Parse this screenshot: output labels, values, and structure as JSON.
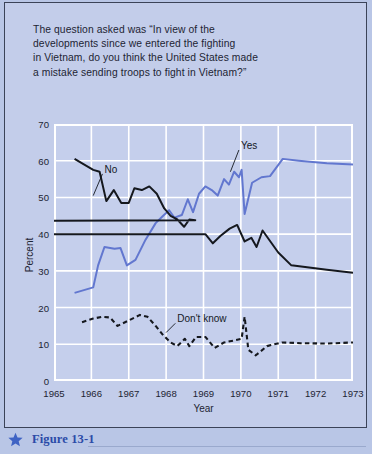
{
  "question": {
    "lines": [
      "The question asked was “In view of the",
      "developments since we entered the fighting",
      "in Vietnam, do you think the United States made",
      "a mistake sending troops to fight in Vietnam?”"
    ]
  },
  "caption": {
    "star_icon": "star-icon",
    "label": "Figure 13-1"
  },
  "colors": {
    "page_background": "#b9c6e6",
    "panel_background": "#c3cdea",
    "plot_background": "#c5cfec",
    "gridline": "#ffffff",
    "yes_series": "#6277cf",
    "no_series": "#15181e",
    "dont_know_series": "#15181e",
    "caption_blue": "#2b4ba8",
    "text": "#1d2433"
  },
  "chart_data": {
    "type": "line",
    "title": "",
    "xlabel": "Year",
    "ylabel": "Percent",
    "xlim": [
      1965,
      1973
    ],
    "ylim": [
      0,
      70
    ],
    "xticks": [
      1965,
      1966,
      1967,
      1968,
      1969,
      1970,
      1971,
      1972,
      1973
    ],
    "yticks": [
      0,
      10,
      20,
      30,
      40,
      50,
      60,
      70
    ],
    "grid": true,
    "legend_position": "inline-annotations",
    "annotations": [
      {
        "text": "No",
        "x": 1966.35,
        "y": 57.5,
        "leader_to_x": 1966.05,
        "leader_to_y": 50.5
      },
      {
        "text": "Yes",
        "x": 1970.0,
        "y": 64.0,
        "leader_to_x": 1969.72,
        "leader_to_y": 57.0
      },
      {
        "text": "Don't know",
        "x": 1968.3,
        "y": 16.8,
        "leader_to_x": 1968.0,
        "leader_to_y": 13.2
      }
    ],
    "series": [
      {
        "name": "Yes",
        "color": "#6277cf",
        "style": "solid",
        "points": [
          [
            1965.55,
            24.0
          ],
          [
            1966.05,
            25.5
          ],
          [
            1966.18,
            31.5
          ],
          [
            1966.35,
            36.5
          ],
          [
            1966.62,
            36.0
          ],
          [
            1966.78,
            36.2
          ],
          [
            1966.95,
            31.5
          ],
          [
            1967.18,
            33.0
          ],
          [
            1967.45,
            38.5
          ],
          [
            1967.72,
            43.0
          ],
          [
            1967.92,
            45.0
          ],
          [
            1968.08,
            46.5
          ],
          [
            1968.22,
            44.5
          ],
          [
            1968.42,
            45.2
          ],
          [
            1968.58,
            49.5
          ],
          [
            1968.72,
            46.0
          ],
          [
            1968.88,
            51.0
          ],
          [
            1969.05,
            53.0
          ],
          [
            1969.22,
            52.0
          ],
          [
            1969.38,
            50.5
          ],
          [
            1969.55,
            55.0
          ],
          [
            1969.68,
            53.5
          ],
          [
            1969.82,
            57.0
          ],
          [
            1969.95,
            55.5
          ],
          [
            1970.02,
            57.5
          ],
          [
            1970.1,
            45.5
          ],
          [
            1970.3,
            54.0
          ],
          [
            1970.55,
            55.5
          ],
          [
            1970.78,
            55.8
          ],
          [
            1971.12,
            60.5
          ],
          [
            1971.55,
            60.0
          ],
          [
            1972.3,
            59.3
          ],
          [
            1973.0,
            59.0
          ]
        ]
      },
      {
        "name": "No",
        "color": "#15181e",
        "style": "solid",
        "points": [
          [
            1965.55,
            60.5
          ],
          [
            1966.05,
            57.5
          ],
          [
            1966.22,
            57.0
          ],
          [
            1966.4,
            49.0
          ],
          [
            1966.6,
            52.0
          ],
          [
            1966.8,
            48.5
          ],
          [
            1967.0,
            48.5
          ],
          [
            1967.15,
            52.5
          ],
          [
            1967.35,
            52.0
          ],
          [
            1967.55,
            53.0
          ],
          [
            1967.75,
            51.0
          ],
          [
            1967.95,
            47.0
          ],
          [
            1968.12,
            45.0
          ],
          [
            1968.3,
            44.0
          ],
          [
            1968.48,
            42.0
          ],
          [
            1968.62,
            44.0
          ],
          [
            1968.78,
            43.8
          ],
          [
            1868.95,
            40.0
          ],
          [
            1969.05,
            40.0
          ],
          [
            1969.25,
            37.5
          ],
          [
            1969.45,
            39.5
          ],
          [
            1969.7,
            41.5
          ],
          [
            1969.9,
            42.5
          ],
          [
            1970.1,
            38.0
          ],
          [
            1970.28,
            39.0
          ],
          [
            1970.42,
            36.5
          ],
          [
            1970.58,
            41.0
          ],
          [
            1971.0,
            35.0
          ],
          [
            1971.35,
            31.5
          ],
          [
            1972.3,
            30.3
          ],
          [
            1973.0,
            29.5
          ]
        ]
      },
      {
        "name": "Don't know",
        "color": "#15181e",
        "style": "dashed",
        "points": [
          [
            1965.75,
            16.0
          ],
          [
            1966.05,
            17.0
          ],
          [
            1966.3,
            17.5
          ],
          [
            1966.5,
            17.3
          ],
          [
            1966.7,
            15.0
          ],
          [
            1966.9,
            16.0
          ],
          [
            1967.1,
            17.0
          ],
          [
            1967.3,
            18.0
          ],
          [
            1967.5,
            17.5
          ],
          [
            1967.72,
            15.0
          ],
          [
            1967.92,
            12.5
          ],
          [
            1968.12,
            10.5
          ],
          [
            1968.3,
            9.5
          ],
          [
            1968.5,
            11.5
          ],
          [
            1968.62,
            9.5
          ],
          [
            1968.8,
            12.0
          ],
          [
            1969.05,
            12.0
          ],
          [
            1969.3,
            9.0
          ],
          [
            1969.55,
            10.5
          ],
          [
            1969.8,
            11.0
          ],
          [
            1970.02,
            11.5
          ],
          [
            1970.1,
            17.5
          ],
          [
            1970.2,
            8.5
          ],
          [
            1970.4,
            7.0
          ],
          [
            1970.7,
            9.5
          ],
          [
            1971.1,
            10.5
          ],
          [
            1971.6,
            10.3
          ],
          [
            1972.3,
            10.2
          ],
          [
            1973.0,
            10.5
          ]
        ]
      }
    ]
  }
}
